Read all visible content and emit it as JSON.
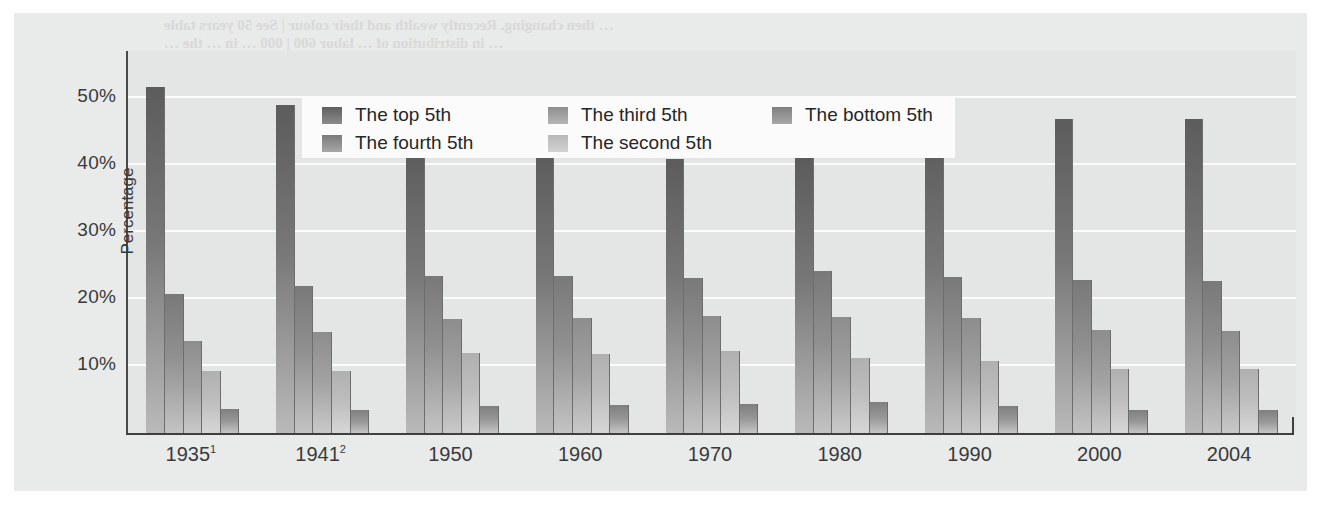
{
  "chart_data": {
    "type": "bar",
    "title": "",
    "xlabel": "",
    "ylabel": "Percentage",
    "ylim": [
      0,
      57
    ],
    "grid": true,
    "legend_position": "top-left-inside",
    "categories": [
      "1935¹",
      "1941²",
      "1950",
      "1960",
      "1970",
      "1980",
      "1990",
      "2000",
      "2004"
    ],
    "ytick_labels": [
      "50%",
      "40%",
      "30%",
      "20%",
      "10%"
    ],
    "ytick_values": [
      50,
      40,
      30,
      20,
      10
    ],
    "series": [
      {
        "name": "The top 5th",
        "values": [
          51.7,
          49.0,
          42.7,
          42.0,
          40.9,
          41.1,
          44.1,
          46.8,
          46.9
        ]
      },
      {
        "name": "The fourth 5th",
        "values": [
          20.7,
          22.0,
          23.4,
          23.5,
          23.2,
          24.2,
          23.3,
          22.9,
          22.7
        ]
      },
      {
        "name": "The third 5th",
        "values": [
          13.8,
          15.0,
          17.0,
          17.2,
          17.4,
          17.3,
          17.1,
          15.4,
          15.2
        ]
      },
      {
        "name": "The second 5th",
        "values": [
          9.2,
          9.3,
          11.9,
          11.8,
          12.2,
          11.2,
          10.7,
          9.6,
          9.6
        ]
      },
      {
        "name": "The bottom 5th",
        "values": [
          3.6,
          3.4,
          4.0,
          4.2,
          4.3,
          4.6,
          4.0,
          3.4,
          3.5
        ]
      }
    ],
    "series_order_legend": [
      "The top 5th",
      "The third 5th",
      "The bottom 5th",
      "The fourth 5th",
      "The second 5th"
    ],
    "colors": {
      "top_5th": "#5c5c5c",
      "fourth_5th": "#797979",
      "third_5th": "#8d8d8d",
      "second_5th": "#b0b0b0",
      "bottom_5th": "#7f7f7f",
      "plot_background": "#e4e5e5",
      "page_background": "#e9eaea",
      "gridline": "#fcfcfc",
      "axis": "#3f3f3f",
      "legend_background": "#fbfbfb",
      "text": "#3a3a3a"
    }
  },
  "legend": {
    "items": [
      {
        "label": "The top 5th",
        "swatch": "s0",
        "col": 0,
        "row": 0
      },
      {
        "label": "The fourth 5th",
        "swatch": "s1",
        "col": 0,
        "row": 1
      },
      {
        "label": "The third 5th",
        "swatch": "s2",
        "col": 1,
        "row": 0
      },
      {
        "label": "The second 5th",
        "swatch": "s3",
        "col": 1,
        "row": 1
      },
      {
        "label": "The bottom 5th",
        "swatch": "s4",
        "col": 2,
        "row": 0
      }
    ]
  },
  "ghost_text": {
    "lines": [
      {
        "text": "… then changing. Recently wealth and their colour | See 50 years table",
        "x": 150,
        "y": 4,
        "size": 15
      },
      {
        "text": "… in distribution of … labor 600 | 000 … in … the …",
        "x": 150,
        "y": 22,
        "size": 15
      },
      {
        "text": "figure",
        "x": 1095,
        "y": 116,
        "size": 14
      },
      {
        "text": "Aggregate Distribution of",
        "x": 885,
        "y": 140,
        "size": 23
      },
      {
        "text": "the Percent of",
        "x": 905,
        "y": 170,
        "size": 23
      },
      {
        "text": "Households",
        "x": 915,
        "y": 200,
        "size": 23
      },
      {
        "text": "Household Distribution of",
        "x": 395,
        "y": 148,
        "size": 21
      },
      {
        "text": "the Income of Each 5th",
        "x": 430,
        "y": 180,
        "size": 21
      },
      {
        "text": "the 5 — in distribution",
        "x": 880,
        "y": 252,
        "size": 14
      },
      {
        "text": "of — aggregate income",
        "x": 880,
        "y": 290,
        "size": 14
      }
    ]
  }
}
